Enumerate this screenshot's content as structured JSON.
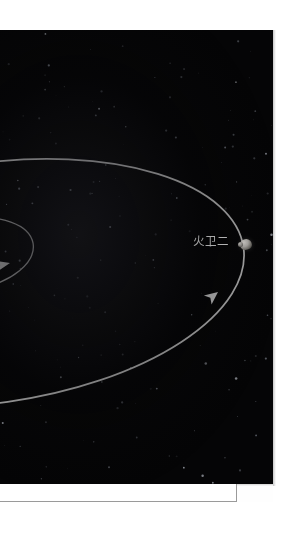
{
  "figure": {
    "kind": "orbital-diagram",
    "background_color": "#050506",
    "labels": [
      {
        "id": "deimos",
        "text": "火卫二",
        "color": "#d8d8d8",
        "x": 197,
        "y": 206
      }
    ],
    "bodies": [
      {
        "id": "deimos-moon",
        "name": "火卫二",
        "x": 244,
        "y": 209,
        "width": 12,
        "height": 11,
        "color": "#b3b0ac"
      }
    ],
    "orbits": [
      {
        "id": "outer-orbit",
        "name": "火卫二轨道",
        "stroke": "#b9b9b9",
        "stroke_width": 1.6
      },
      {
        "id": "inner-orbit",
        "name": "火卫一轨道",
        "stroke": "#9a9a9a",
        "stroke_width": 1.3
      }
    ],
    "direction_arrows": [
      {
        "id": "outer-orbit-arrow",
        "x": 218,
        "y": 290,
        "rotation": -38
      },
      {
        "id": "inner-orbit-arrow",
        "x": 8,
        "y": 262,
        "rotation": -18
      }
    ],
    "starfield": {
      "star_color": "#9aa0ab",
      "count": 150
    }
  },
  "document": {
    "page_background": "#ffffff",
    "box_border_color": "#9a9a9a"
  }
}
